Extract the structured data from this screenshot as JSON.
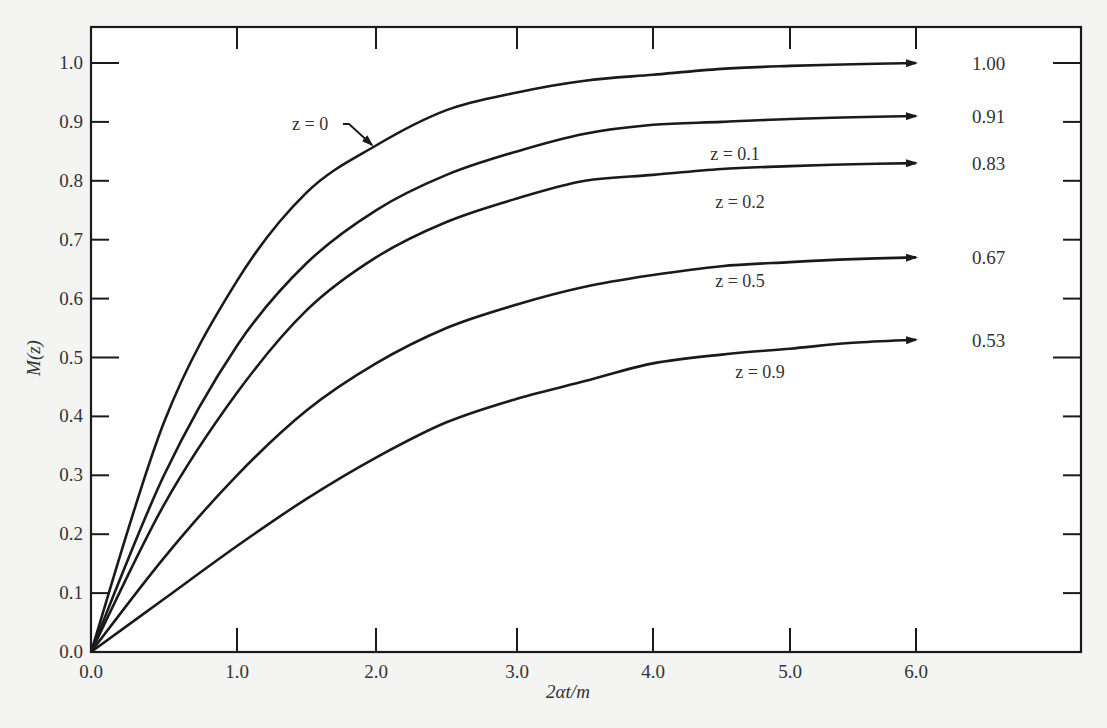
{
  "chart_data": {
    "type": "line",
    "title": "",
    "xlabel": "2αt/m",
    "ylabel": "M(z)",
    "xlim": [
      0.0,
      6.8
    ],
    "ylim": [
      0.0,
      1.06
    ],
    "grid": false,
    "legend": "inline labels with arrows at curve ends",
    "x_ticks": [
      "0.0",
      "1.0",
      "2.0",
      "3.0",
      "4.0",
      "5.0",
      "6.0"
    ],
    "y_ticks": [
      "0.0",
      "0.1",
      "0.2",
      "0.3",
      "0.4",
      "0.5",
      "0.6",
      "0.7",
      "0.8",
      "0.9",
      "1.0"
    ],
    "x": [
      0.0,
      0.5,
      1.0,
      1.5,
      2.0,
      2.5,
      3.0,
      3.5,
      4.0,
      4.5,
      5.0,
      5.5,
      6.0
    ],
    "series": [
      {
        "name": "z = 0",
        "asymptote_label": "1.00",
        "values": [
          0.0,
          0.39,
          0.63,
          0.78,
          0.86,
          0.92,
          0.95,
          0.97,
          0.98,
          0.99,
          0.995,
          0.998,
          1.0
        ]
      },
      {
        "name": "z = 0.1",
        "asymptote_label": "0.91",
        "values": [
          0.0,
          0.3,
          0.52,
          0.66,
          0.75,
          0.81,
          0.85,
          0.88,
          0.895,
          0.9,
          0.905,
          0.908,
          0.91
        ]
      },
      {
        "name": "z = 0.2",
        "asymptote_label": "0.83",
        "values": [
          0.0,
          0.25,
          0.44,
          0.58,
          0.67,
          0.73,
          0.77,
          0.8,
          0.81,
          0.82,
          0.825,
          0.828,
          0.83
        ]
      },
      {
        "name": "z = 0.5",
        "asymptote_label": "0.67",
        "values": [
          0.0,
          0.16,
          0.3,
          0.41,
          0.49,
          0.55,
          0.59,
          0.62,
          0.64,
          0.655,
          0.662,
          0.667,
          0.67
        ]
      },
      {
        "name": "z = 0.9",
        "asymptote_label": "0.53",
        "values": [
          0.0,
          0.09,
          0.18,
          0.26,
          0.33,
          0.39,
          0.43,
          0.46,
          0.49,
          0.505,
          0.515,
          0.525,
          0.53
        ]
      }
    ],
    "annotations": [
      {
        "text": "z = 0",
        "arrow_to": "curve z = 0 near x≈2.0"
      }
    ]
  },
  "colors": {
    "background": "#f4f4f2",
    "plot_bg": "#ffffff",
    "ink": "#1a1a1a"
  }
}
